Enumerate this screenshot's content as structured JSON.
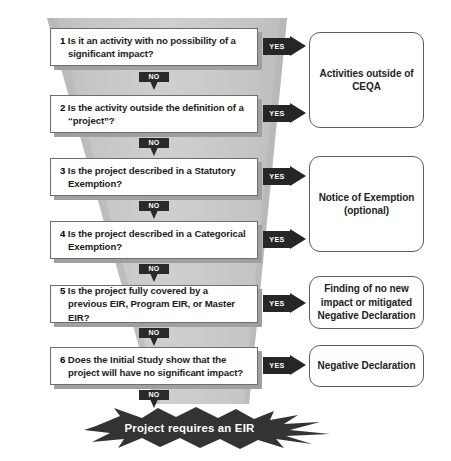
{
  "diagram": {
    "colors": {
      "funnel_fill": "#c9c9c9",
      "funnel_edge": "#b0b0b0",
      "box_border": "#6e6e6e",
      "box_shadow": "#a0a0a0",
      "arrow_dark": "#262626",
      "banner_dark": "#333333",
      "text_dark": "#1c1c1c",
      "page_background": "#ffffff"
    },
    "labels": {
      "yes": "YES",
      "no": "NO"
    }
  },
  "questions": [
    {
      "number": "1",
      "text": "Is it an activity with no possibility of a significant impact?",
      "yes_label": "YES",
      "no_label": "NO"
    },
    {
      "number": "2",
      "text": "Is the activity outside the definition of a “project”?",
      "yes_label": "YES",
      "no_label": "NO"
    },
    {
      "number": "3",
      "text": "Is the project described in a Statutory Exemption?",
      "yes_label": "YES",
      "no_label": "NO"
    },
    {
      "number": "4",
      "text": "Is the project described in a Categorical Exemption?",
      "yes_label": "YES",
      "no_label": "NO"
    },
    {
      "number": "5",
      "text": "Is the project fully covered by a previous EIR, Program EIR, or Master EIR?",
      "yes_label": "YES",
      "no_label": "NO"
    },
    {
      "number": "6",
      "text": "Does the Initial Study show that the project will have no significant impact?",
      "yes_label": "YES",
      "no_label": "NO"
    }
  ],
  "outcomes": [
    {
      "text": "Activities outside of CEQA"
    },
    {
      "text": "Notice of Exemption (optional)"
    },
    {
      "text": "Finding of no new impact or mitigated Negative Declaration"
    },
    {
      "text": "Negative Declaration"
    }
  ],
  "final_outcome": {
    "text": "Project requires an EIR"
  }
}
